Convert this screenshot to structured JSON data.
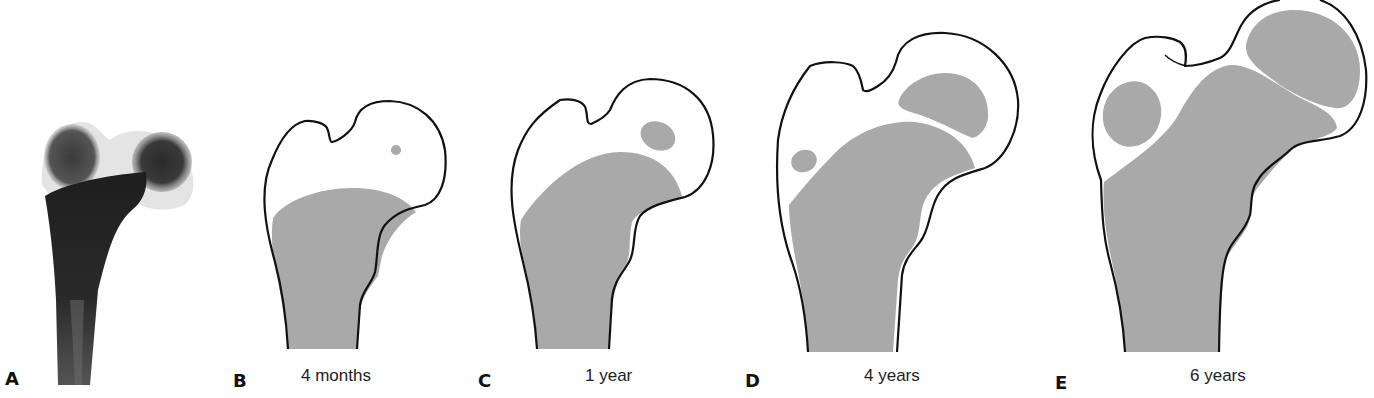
{
  "figure": {
    "fill_color": "#a9a9a9",
    "outline_color": "#111111",
    "panels": [
      {
        "letter": "A",
        "caption": "",
        "kind": "radiograph"
      },
      {
        "letter": "B",
        "caption": "4 months",
        "kind": "drawing"
      },
      {
        "letter": "C",
        "caption": "1 year",
        "kind": "drawing"
      },
      {
        "letter": "D",
        "caption": "4 years",
        "kind": "drawing"
      },
      {
        "letter": "E",
        "caption": "6 years",
        "kind": "drawing"
      }
    ]
  }
}
